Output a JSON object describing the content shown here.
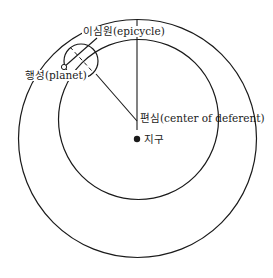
{
  "labels": {
    "epicycle": "이심원(epicycle)",
    "planet": "행성(planet)",
    "center_of_deferent": "편심(center of deferent)",
    "earth": "지구"
  },
  "colors": {
    "line": "#1a1a1a",
    "background": "#ffffff"
  }
}
